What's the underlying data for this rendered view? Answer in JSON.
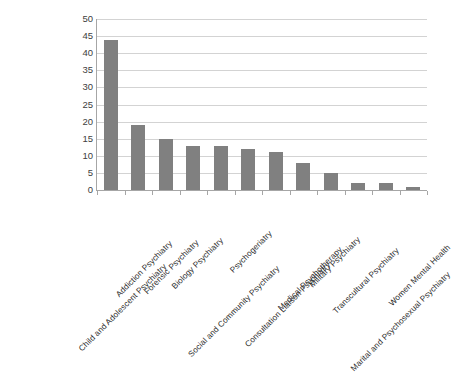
{
  "chart_data": {
    "type": "bar",
    "title": "",
    "subtitle": "",
    "xlabel": "",
    "ylabel": "",
    "ylim": [
      0,
      50
    ],
    "ytick_step": 5,
    "yticks": [
      "50",
      "45",
      "40",
      "35",
      "30",
      "25",
      "20",
      "15",
      "10",
      "5",
      "0"
    ],
    "grid": true,
    "legend": false,
    "legend_position": "none",
    "orientation": "vertical",
    "bar_color": "#808080",
    "gridline_color": "#d3d3d3",
    "axis_color": "#a6a6a6",
    "categories": [
      "Child and Adolescent Psychiatry",
      "Addiction Psychiatry",
      "Forensic Psychiatry",
      "Biology Psychiatry",
      "Social and Community Psychiatry",
      "Psychogeriatry",
      "Consultation Liaison Psychiatry",
      "Medical Psychotherapy",
      "Military Psychiatry",
      "Transcultural Psychiatry",
      "Marital and Psychosexual Psychiatry",
      "Women Mental Health"
    ],
    "values": [
      44,
      19,
      15,
      13,
      13,
      12,
      11,
      8,
      5,
      2,
      2,
      1
    ]
  }
}
